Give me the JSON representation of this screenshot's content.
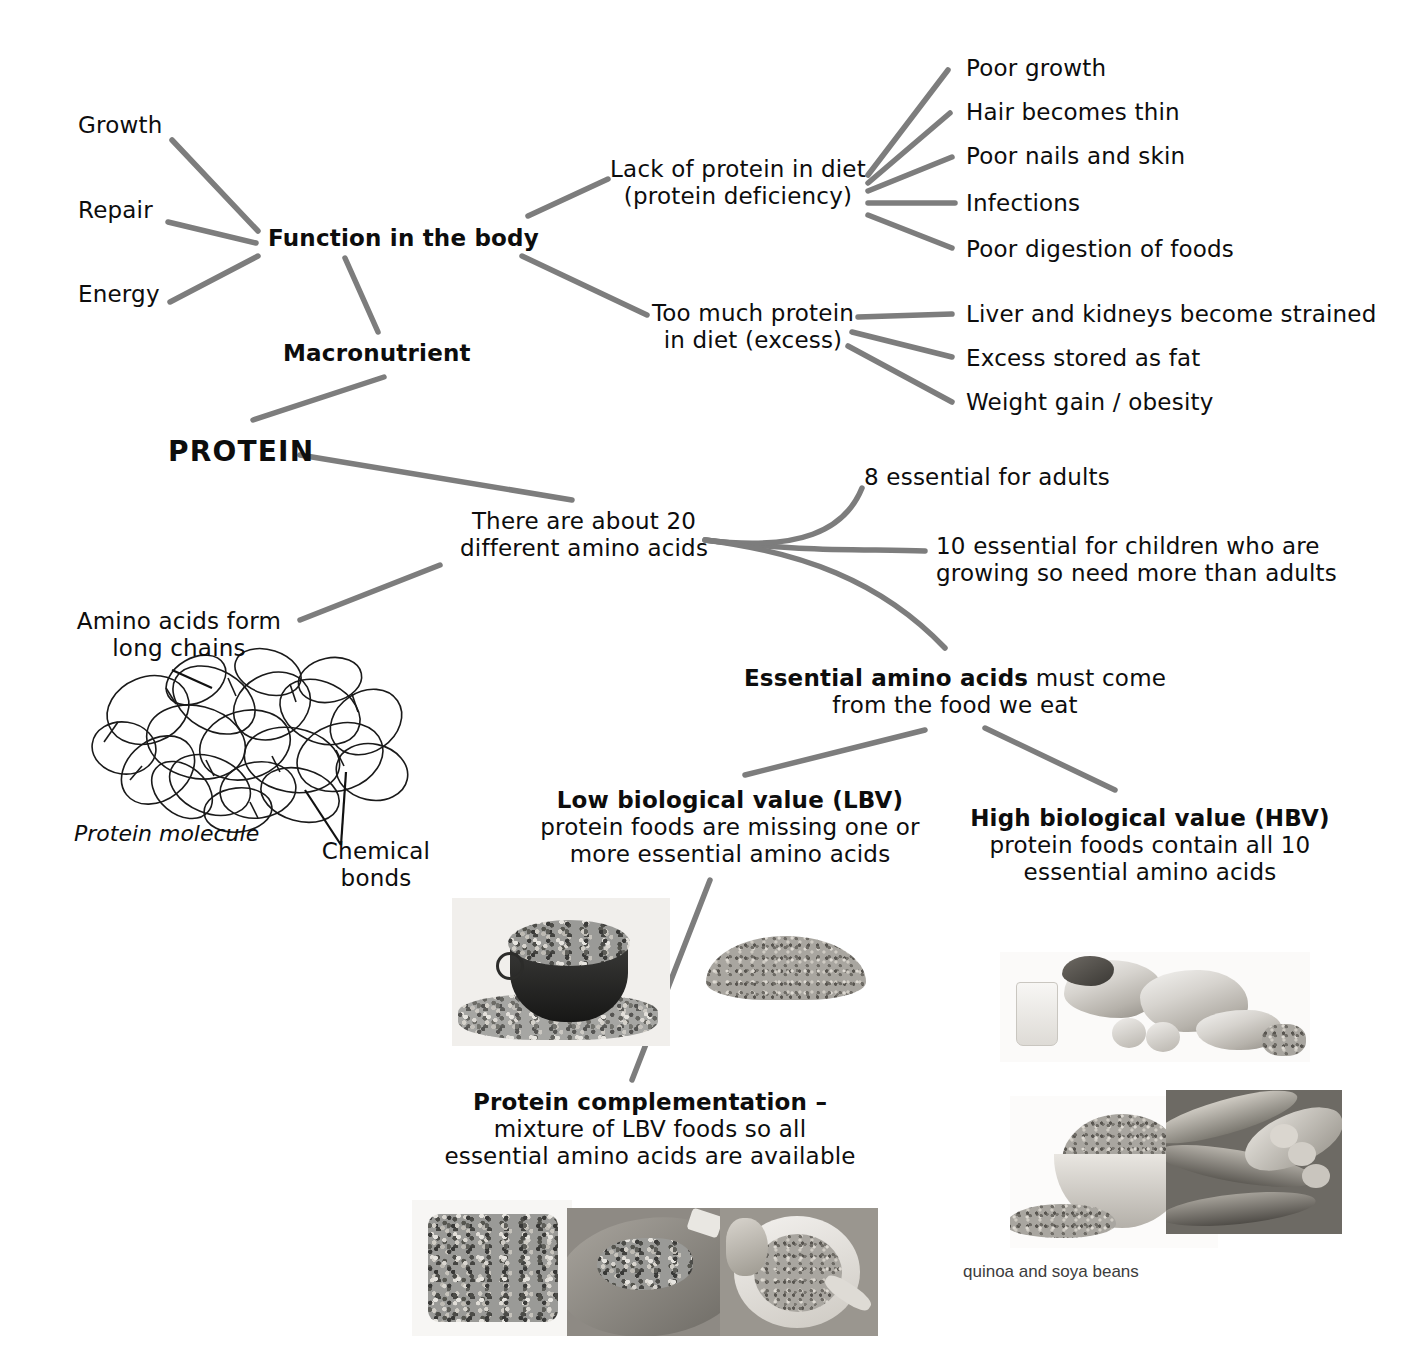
{
  "diagram": {
    "line_color": "#7d7d7d",
    "text_color": "#0d0d0d"
  },
  "center": {
    "label": "PROTEIN"
  },
  "branches": {
    "macronutrient": "Macronutrient",
    "function": "Function in the body",
    "functions_list": [
      "Growth",
      "Repair",
      "Energy"
    ],
    "deficiency": {
      "line1": "Lack of protein in diet",
      "line2": "(protein deficiency)",
      "effects": [
        "Poor growth",
        "Hair becomes thin",
        "Poor nails and skin",
        "Infections",
        "Poor digestion of foods"
      ]
    },
    "excess": {
      "line1": "Too much protein",
      "line2": "in diet (excess)",
      "effects": [
        "Liver and kidneys become strained",
        "Excess stored as fat",
        "Weight gain / obesity"
      ]
    }
  },
  "amino": {
    "about20": {
      "line1": "There are about 20",
      "line2": "different amino acids"
    },
    "adults": "8 essential for adults",
    "children": {
      "line1": "10 essential for children who are",
      "line2": "growing so need more than adults"
    },
    "essential": {
      "bold": "Essential amino acids",
      "rest": " must come",
      "line2": "from the food we eat"
    },
    "chains": {
      "line1": "Amino acids form",
      "line2": "long chains"
    },
    "molecule_label": "Protein molecule",
    "bonds": {
      "line1": "Chemical",
      "line2": "bonds"
    }
  },
  "value": {
    "lbv": {
      "bold": "Low biological value (LBV)",
      "line2": "protein foods are missing one or",
      "line3": "more essential amino acids"
    },
    "hbv": {
      "bold": "High biological value (HBV)",
      "line2": "protein foods contain all 10",
      "line3": "essential amino acids"
    },
    "complementation": {
      "bold": "Protein complementation –",
      "line2": "mixture of LBV foods so all",
      "line3": "essential amino acids are available"
    }
  },
  "captions": {
    "quinoa_soya": "quinoa and soya beans"
  },
  "photos": {
    "lbv_bowl": "bowl-of-mixed-beans-photo",
    "lbv_pile": "pile-of-lentils-photo",
    "hbv_spread": "milk-meat-eggs-fish-photo",
    "quinoa_bowl": "bowl-of-quinoa-photo",
    "soya_pods": "soya-bean-pods-photo",
    "beans_on_toast": "beans-on-toast-photo",
    "chilli_rice": "chilli-with-rice-photo",
    "lentil_soup": "lentil-soup-photo"
  }
}
